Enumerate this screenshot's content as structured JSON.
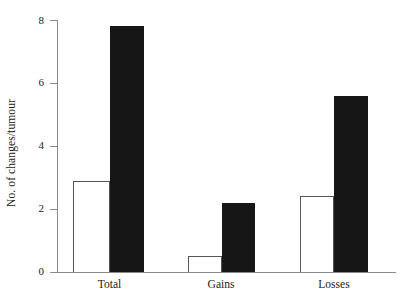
{
  "chart_data": {
    "type": "bar",
    "title": "",
    "xlabel": "",
    "ylabel": "No. of changes/tumour",
    "categories": [
      "Total",
      "Gains",
      "Losses"
    ],
    "series": [
      {
        "name": "open",
        "values": [
          2.9,
          0.5,
          2.4
        ]
      },
      {
        "name": "filled",
        "values": [
          7.8,
          2.2,
          5.6
        ]
      }
    ],
    "ylim": [
      0,
      8
    ],
    "yticks": [
      0,
      2,
      4,
      6,
      8
    ],
    "ytick_labels": [
      "0",
      "2",
      "4",
      "6",
      "8"
    ],
    "grid": false,
    "legend": "none",
    "colors": {
      "open_bar_fill": "#ffffff",
      "open_bar_edge": "#555555",
      "filled_bar": "#161616",
      "axis": "#8a8a8a",
      "text": "#1b1b1b",
      "background": "#ffffff"
    }
  },
  "axis": {
    "y_title": "No. of changes/tumour",
    "ticks": [
      {
        "label": "8",
        "value": 8
      },
      {
        "label": "6",
        "value": 6
      },
      {
        "label": "4",
        "value": 4
      },
      {
        "label": "2",
        "value": 2
      },
      {
        "label": "0",
        "value": 0
      }
    ]
  },
  "groups": [
    {
      "label": "Total",
      "open": 2.9,
      "filled": 7.8
    },
    {
      "label": "Gains",
      "open": 0.5,
      "filled": 2.2
    },
    {
      "label": "Losses",
      "open": 2.4,
      "filled": 5.6
    }
  ]
}
